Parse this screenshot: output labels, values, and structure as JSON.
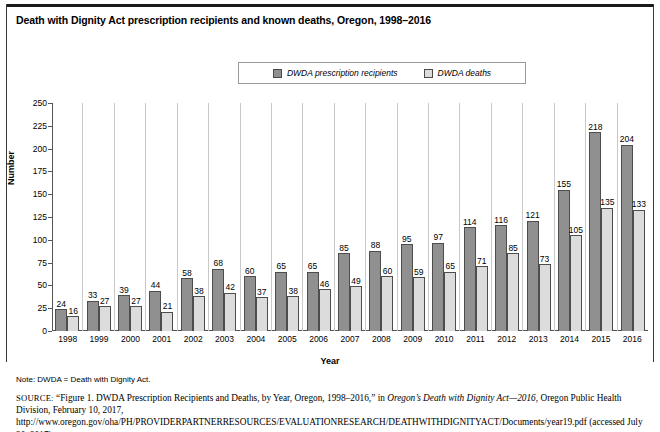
{
  "title": "Death with Dignity Act prescription recipients and known deaths, Oregon, 1998–2016",
  "legend": {
    "items": [
      {
        "label": "DWDA prescription recipients",
        "color": "#909090",
        "name": "recipients"
      },
      {
        "label": "DWDA deaths",
        "color": "#dcdcdc",
        "name": "deaths"
      }
    ]
  },
  "footer": {
    "note": "Note: DWDA = Death with Dignity Act.",
    "source_prefix": "SOURCE:",
    "source_part1": " “Figure 1. DWDA Prescription Recipients and Deaths, by Year, Oregon, 1998–2016,” in ",
    "source_italic": "Oregon’s Death with Dignity Act—2016",
    "source_part2": ", Oregon Public Health Division, February 10, 2017, http://www.oregon.gov/oha/PH/PROVIDERPARTNERRESOURCES/EVALUATIONRESEARCH/DEATHWITHDIGNITYACT/Documents/year19.pdf (accessed July 20, 2017)"
  },
  "chart_data": {
    "type": "bar",
    "title": "Death with Dignity Act prescription recipients and known deaths, Oregon, 1998–2016",
    "xlabel": "Year",
    "ylabel": "Number",
    "ylim": [
      0,
      250
    ],
    "yticks": [
      0,
      25,
      50,
      75,
      100,
      125,
      150,
      175,
      200,
      225,
      250
    ],
    "grid": false,
    "legend_position": "top-center",
    "categories": [
      "1998",
      "1999",
      "2000",
      "2001",
      "2002",
      "2003",
      "2004",
      "2005",
      "2006",
      "2007",
      "2008",
      "2009",
      "2010",
      "2011",
      "2012",
      "2013",
      "2014",
      "2015",
      "2016"
    ],
    "series": [
      {
        "name": "DWDA prescription recipients",
        "color": "#909090",
        "values": [
          24,
          33,
          39,
          44,
          58,
          68,
          60,
          65,
          65,
          85,
          88,
          95,
          97,
          114,
          116,
          121,
          155,
          218,
          204
        ]
      },
      {
        "name": "DWDA deaths",
        "color": "#dcdcdc",
        "values": [
          16,
          27,
          27,
          21,
          38,
          42,
          37,
          38,
          46,
          49,
          60,
          59,
          65,
          71,
          85,
          73,
          105,
          135,
          133
        ]
      }
    ]
  }
}
